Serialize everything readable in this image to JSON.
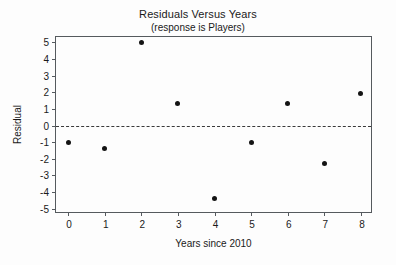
{
  "chart_data": {
    "type": "scatter",
    "title": "Residuals Versus Years",
    "subtitle": "(response is Players)",
    "xlabel": "Years since 2010",
    "ylabel": "Residual",
    "x": [
      0,
      1,
      2,
      3,
      4,
      5,
      6,
      7,
      8
    ],
    "values": [
      -1.0,
      -1.4,
      5.0,
      1.3,
      -4.4,
      -1.05,
      1.35,
      -2.3,
      1.95
    ],
    "series": [
      {
        "name": "Residual",
        "values": [
          -1.0,
          -1.4,
          5.0,
          1.3,
          -4.4,
          -1.05,
          1.35,
          -2.3,
          1.95
        ]
      }
    ],
    "points": [
      {
        "x": 0,
        "y": -1.0
      },
      {
        "x": 1,
        "y": -1.4
      },
      {
        "x": 2,
        "y": 5.0
      },
      {
        "x": 3,
        "y": 1.3
      },
      {
        "x": 4,
        "y": -4.4
      },
      {
        "x": 5,
        "y": -1.05
      },
      {
        "x": 6,
        "y": 1.35
      },
      {
        "x": 7,
        "y": -2.3
      },
      {
        "x": 8,
        "y": 1.95
      }
    ],
    "xlim": [
      -0.33,
      8.33
    ],
    "ylim": [
      -5.33,
      5.33
    ],
    "xticks": [
      0,
      1,
      2,
      3,
      4,
      5,
      6,
      7,
      8
    ],
    "xtick_labels": [
      "0",
      "1",
      "2",
      "3",
      "4",
      "5",
      "6",
      "7",
      "8"
    ],
    "yticks": [
      5,
      4,
      3,
      2,
      1,
      0,
      -1,
      -2,
      -3,
      -4,
      -5
    ],
    "ytick_labels": [
      "5",
      "4",
      "3",
      "2",
      "1",
      "0",
      "-1",
      "-2",
      "-3",
      "-4",
      "-5"
    ],
    "grid": false,
    "legend": false,
    "reference_line": {
      "axis": "y",
      "value": 0,
      "style": "dashed"
    },
    "colors": {
      "marker": "#141414",
      "axis": "#555a5e",
      "reference_line": "#3a3a3a",
      "background": "#fdfdfd",
      "text": "#1a1a1a"
    }
  }
}
